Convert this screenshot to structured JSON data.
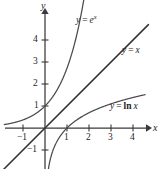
{
  "figure": {
    "background_color": "#ffffff",
    "axis_color": "#3a3a3c",
    "curve_color": "#4a4a4e",
    "width": 161,
    "height": 169
  },
  "axes": {
    "x_axis_label": "x",
    "y_axis_label": "y",
    "x_ticks": [
      {
        "value": -1,
        "label": "−1"
      },
      {
        "value": 1,
        "label": "1"
      },
      {
        "value": 2,
        "label": "2"
      },
      {
        "value": 3,
        "label": "3"
      },
      {
        "value": 4,
        "label": "4"
      }
    ],
    "y_ticks": [
      {
        "value": 4,
        "label": "4"
      },
      {
        "value": 3,
        "label": "3"
      },
      {
        "value": 2,
        "label": "2"
      },
      {
        "value": 1,
        "label": "1"
      },
      {
        "value": -1,
        "label": "−1"
      }
    ]
  },
  "curve_labels": {
    "exp": {
      "lhs": "y",
      "eq": "=",
      "base": "e",
      "exponent": "x"
    },
    "identity": {
      "lhs": "y",
      "eq": "=",
      "rhs": "x"
    },
    "log": {
      "lhs": "y",
      "eq": "=",
      "fn": "ln",
      "arg": "x"
    }
  },
  "chart_data": {
    "type": "line",
    "title": "",
    "xlabel": "x",
    "ylabel": "y",
    "xlim": [
      -1.8,
      4.7
    ],
    "ylim": [
      -1.9,
      5.4
    ],
    "grid": false,
    "legend": "inline-labels",
    "xticks": [
      -1,
      1,
      2,
      3,
      4
    ],
    "yticks": [
      -1,
      1,
      2,
      3,
      4
    ],
    "series": [
      {
        "name": "y = e^x",
        "formula": "y = exp(x)",
        "label_text": "y = e^x",
        "x": [
          -1.8,
          -1.5,
          -1.0,
          -0.5,
          0.0,
          0.5,
          1.0,
          1.3,
          1.5,
          1.7
        ],
        "values": [
          0.165,
          0.223,
          0.368,
          0.607,
          1.0,
          1.649,
          2.718,
          3.669,
          4.482,
          5.474
        ]
      },
      {
        "name": "y = x",
        "formula": "y = x",
        "label_text": "y = x",
        "x": [
          -1.9,
          0.0,
          4.7
        ],
        "values": [
          -1.9,
          0.0,
          4.7
        ]
      },
      {
        "name": "y = ln x",
        "formula": "y = ln(x)",
        "label_text": "y = ln x",
        "x": [
          0.16,
          0.25,
          0.4,
          0.6,
          1.0,
          1.5,
          2.0,
          2.5,
          3.0,
          3.5,
          4.0,
          4.5
        ],
        "values": [
          -1.83,
          -1.386,
          -0.916,
          -0.511,
          0.0,
          0.405,
          0.693,
          0.916,
          1.099,
          1.253,
          1.386,
          1.504
        ]
      }
    ],
    "key_points": [
      {
        "label": "y-intercept of y = e^x",
        "x": 0,
        "y": 1
      },
      {
        "label": "x-intercept of y = ln x",
        "x": 1,
        "y": 0
      }
    ]
  }
}
